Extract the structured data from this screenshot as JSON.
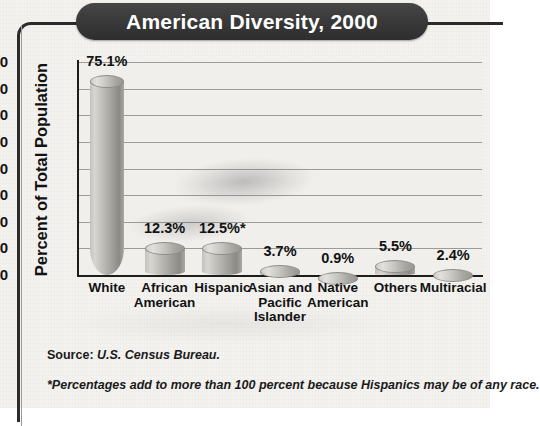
{
  "title": "American Diversity, 2000",
  "chart_data": {
    "type": "bar",
    "title": "American Diversity, 2000",
    "xlabel": "",
    "ylabel": "Percent of Total Population",
    "ylim": [
      0,
      80
    ],
    "yticks": [
      "0",
      "10",
      "20",
      "30",
      "40",
      "50",
      "60",
      "70",
      "80"
    ],
    "grid": true,
    "legend": "none",
    "categories": [
      "White",
      "African American",
      "Hispanic",
      "Asian and Pacific Islander",
      "Native American",
      "Others",
      "Multiracial"
    ],
    "category_lines": [
      [
        "White"
      ],
      [
        "African",
        "American"
      ],
      [
        "Hispanic"
      ],
      [
        "Asian and",
        "Pacific",
        "Islander"
      ],
      [
        "Native",
        "American"
      ],
      [
        "Others"
      ],
      [
        "Multiracial"
      ]
    ],
    "values": [
      75.1,
      12.3,
      12.5,
      3.7,
      0.9,
      5.5,
      2.4
    ],
    "value_labels": [
      "75.1%",
      "12.3%",
      "12.5%*",
      "3.7%",
      "0.9%",
      "5.5%",
      "2.4%"
    ],
    "annotations": [
      "Source: U.S. Census Bureau.",
      "*Percentages add to more than 100 percent because Hispanics may be of any race."
    ]
  },
  "notes": {
    "source_prefix": "Source: ",
    "source_value": "U.S. Census Bureau.",
    "footnote": "*Percentages add to more than 100 percent because Hispanics may be of any race."
  },
  "colors": {
    "title_pill": "#3a3a3a",
    "title_text": "#ffffff",
    "bar_light": "#d7d6d2",
    "bar_dark": "#8b8a85",
    "axis": "#1d1d1d",
    "gridline": "#9b9b99",
    "background": "#f2f1ee"
  }
}
